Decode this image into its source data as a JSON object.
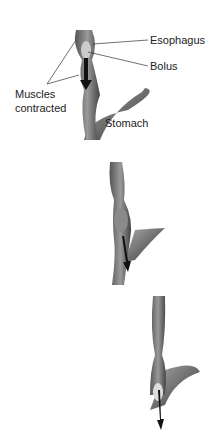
{
  "figure": {
    "panels": [
      {
        "stage": 1,
        "labels": {
          "esophagus": "Esophagus",
          "bolus": "Bolus",
          "muscles": [
            "Muscles",
            "contracted"
          ],
          "stomach": "Stomach"
        }
      },
      {
        "stage": 2
      },
      {
        "stage": 3
      }
    ]
  }
}
